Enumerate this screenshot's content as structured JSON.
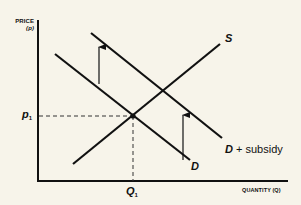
{
  "diagram": {
    "type": "supply-demand",
    "y_axis": {
      "label_line1": "PRICE",
      "label_line2": "(p)"
    },
    "x_axis": {
      "label": "QUANTITY (Q)"
    },
    "curves": {
      "supply": {
        "label": "S"
      },
      "demand": {
        "label": "D"
      },
      "demand_subsidy": {
        "label_italic": "D",
        "label_rest": " + subsidy"
      }
    },
    "equilibrium": {
      "price_label": "p",
      "price_sub": "1",
      "quantity_label": "Q",
      "quantity_sub": "1"
    },
    "arrows": [
      {
        "meaning": "upward shift of demand due to subsidy"
      },
      {
        "meaning": "upward shift of demand due to subsidy"
      }
    ],
    "colors": {
      "line": "#111111",
      "background": "#f7f4ea"
    }
  }
}
